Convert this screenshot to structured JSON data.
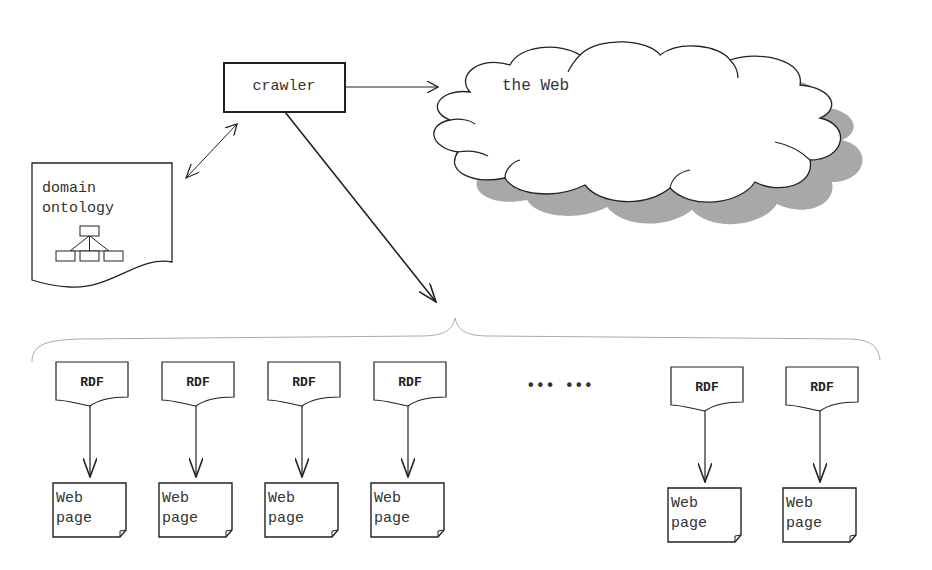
{
  "diagram": {
    "crawler": {
      "label": "crawler"
    },
    "web": {
      "label": "the Web"
    },
    "ontology": {
      "line1": "domain",
      "line2": "ontology"
    },
    "ellipsis": "••• •••",
    "rdf_label": "RDF",
    "webpage_line1": "Web",
    "webpage_line2": "page",
    "pairs": [
      {
        "rdf": "RDF",
        "page1": "Web",
        "page2": "page"
      },
      {
        "rdf": "RDF",
        "page1": "Web",
        "page2": "page"
      },
      {
        "rdf": "RDF",
        "page1": "Web",
        "page2": "page"
      },
      {
        "rdf": "RDF",
        "page1": "Web",
        "page2": "page"
      },
      {
        "rdf": "RDF",
        "page1": "Web",
        "page2": "page"
      },
      {
        "rdf": "RDF",
        "page1": "Web",
        "page2": "page"
      }
    ],
    "colors": {
      "stroke": "#222222",
      "shadow": "#a8a8a8",
      "brace": "#aaaaaa"
    }
  }
}
